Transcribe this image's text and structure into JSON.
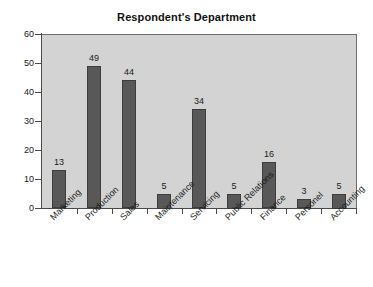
{
  "chart_data": {
    "type": "bar",
    "title": "Respondent's Department",
    "xlabel": "",
    "ylabel": "",
    "categories": [
      "Marketing",
      "Production",
      "Sales",
      "Maintenance",
      "Servicing",
      "Public Relations",
      "Finance",
      "Personel",
      "Accounting"
    ],
    "values": [
      13,
      49,
      44,
      5,
      34,
      5,
      16,
      3,
      5
    ],
    "ylim": [
      0,
      60
    ],
    "yticks": [
      0,
      10,
      20,
      30,
      40,
      50,
      60
    ],
    "ytick_labels": [
      "0",
      "10",
      "20",
      "30",
      "40",
      "50",
      "60"
    ],
    "grid": false,
    "legend": false,
    "data_labels": true,
    "colors": {
      "bar_fill": "#585858",
      "bar_edge": "#3d3d3d",
      "plot_background": "#d3d3d3",
      "figure_background": "#ffffff",
      "axis": "#4a4a4a",
      "text": "#1a1a1a"
    }
  }
}
